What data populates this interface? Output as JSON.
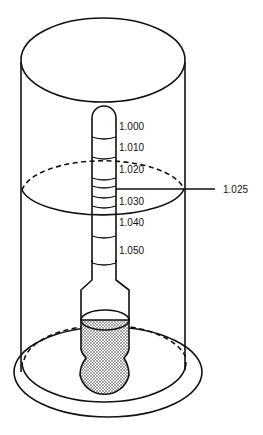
{
  "diagram": {
    "scale_labels": [
      "1.000",
      "1.010",
      "1.020",
      "1.030",
      "1.040",
      "1.050"
    ],
    "reading_label": "1.025",
    "colors": {
      "line": "#111111",
      "background": "#ffffff",
      "bulb_fill": "#9a9a9a"
    }
  }
}
